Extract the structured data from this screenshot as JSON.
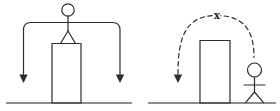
{
  "colors": {
    "ink": "#2d2d2d",
    "ground": "#666666"
  },
  "right_diagram": {
    "blocked_mark_label": "x"
  }
}
